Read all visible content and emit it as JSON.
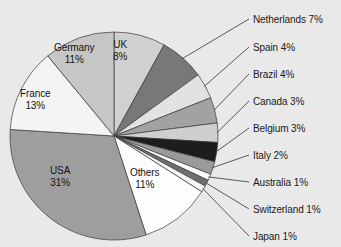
{
  "chart_data": {
    "type": "pie",
    "title": "",
    "subtitle": "",
    "xlabel": "",
    "ylabel": "",
    "legend_position": "none",
    "grid": false,
    "units": "percent",
    "total": 100,
    "start_angle_deg": 0,
    "direction": "clockwise",
    "categories": [
      "UK",
      "Netherlands",
      "Spain",
      "Brazil",
      "Canada",
      "Belgium",
      "Italy",
      "Australia",
      "Switzerland",
      "Japan",
      "Others",
      "USA",
      "France",
      "Germany"
    ],
    "values": [
      8,
      7,
      4,
      4,
      3,
      3,
      2,
      1,
      1,
      1,
      11,
      31,
      13,
      11
    ],
    "slices": [
      {
        "name": "UK",
        "value": 8,
        "label": "UK",
        "value_label": "8%",
        "color": "#d0d0d0",
        "label_placement": "inside"
      },
      {
        "name": "Netherlands",
        "value": 7,
        "label": "Netherlands",
        "value_label": "7%",
        "color": "#787878",
        "label_placement": "outside"
      },
      {
        "name": "Spain",
        "value": 4,
        "label": "Spain",
        "value_label": "4%",
        "color": "#e2e2e2",
        "label_placement": "outside"
      },
      {
        "name": "Brazil",
        "value": 4,
        "label": "Brazil",
        "value_label": "4%",
        "color": "#a2a2a2",
        "label_placement": "outside"
      },
      {
        "name": "Canada",
        "value": 3,
        "label": "Canada",
        "value_label": "3%",
        "color": "#cfcfcf",
        "label_placement": "outside"
      },
      {
        "name": "Belgium",
        "value": 3,
        "label": "Belgium",
        "value_label": "3%",
        "color": "#1d1d1d",
        "label_placement": "outside"
      },
      {
        "name": "Italy",
        "value": 2,
        "label": "Italy",
        "value_label": "2%",
        "color": "#9a9a9a",
        "label_placement": "outside"
      },
      {
        "name": "Australia",
        "value": 1,
        "label": "Australia",
        "value_label": "1%",
        "color": "#fbfbfb",
        "label_placement": "outside"
      },
      {
        "name": "Switzerland",
        "value": 1,
        "label": "Switzerland",
        "value_label": "1%",
        "color": "#6f6f6f",
        "label_placement": "outside"
      },
      {
        "name": "Japan",
        "value": 1,
        "label": "Japan",
        "value_label": "1%",
        "color": "#f7f7f7",
        "label_placement": "outside"
      },
      {
        "name": "Others",
        "value": 11,
        "label": "Others",
        "value_label": "11%",
        "color": "#fdfdfd",
        "label_placement": "inside"
      },
      {
        "name": "USA",
        "value": 31,
        "label": "USA",
        "value_label": "31%",
        "color": "#9e9e9e",
        "label_placement": "inside"
      },
      {
        "name": "France",
        "value": 13,
        "label": "France",
        "value_label": "13%",
        "color": "#f4f4f4",
        "label_placement": "inside"
      },
      {
        "name": "Germany",
        "value": 11,
        "label": "Germany",
        "value_label": "11%",
        "color": "#c6c6c6",
        "label_placement": "inside"
      }
    ]
  },
  "inner_labels": [
    {
      "name": "Germany",
      "label": "Germany",
      "value_label": "11%",
      "x": 54,
      "y": 42
    },
    {
      "name": "UK",
      "label": "UK",
      "value_label": "8%",
      "x": 113,
      "y": 39
    },
    {
      "name": "France",
      "label": "France",
      "value_label": "13%",
      "x": 20,
      "y": 88
    },
    {
      "name": "USA",
      "label": "USA",
      "value_label": "31%",
      "x": 50,
      "y": 165
    },
    {
      "name": "Others",
      "label": "Others",
      "value_label": "11%",
      "x": 130,
      "y": 167
    }
  ],
  "outer_labels": [
    {
      "name": "Netherlands",
      "text": "Netherlands 7%",
      "x": 253,
      "y": 14
    },
    {
      "name": "Spain",
      "text": "Spain 4%",
      "x": 253,
      "y": 42
    },
    {
      "name": "Brazil",
      "text": "Brazil 4%",
      "x": 253,
      "y": 69
    },
    {
      "name": "Canada",
      "text": "Canada 3%",
      "x": 253,
      "y": 96
    },
    {
      "name": "Belgium",
      "text": "Belgium 3%",
      "x": 253,
      "y": 123
    },
    {
      "name": "Italy",
      "text": "Italy 2%",
      "x": 253,
      "y": 150
    },
    {
      "name": "Australia",
      "text": "Australia 1%",
      "x": 253,
      "y": 177
    },
    {
      "name": "Switzerland",
      "text": "Switzerland 1%",
      "x": 253,
      "y": 204
    },
    {
      "name": "Japan",
      "text": "Japan 1%",
      "x": 253,
      "y": 231
    }
  ],
  "geometry": {
    "cx": 114,
    "cy": 136,
    "r": 104,
    "label_anchor_x": 249
  },
  "colors": {
    "background": "#e9e9e9",
    "outline": "#3a3a3a",
    "leader": "#4a4a4a",
    "text": "#1b1b1b"
  }
}
